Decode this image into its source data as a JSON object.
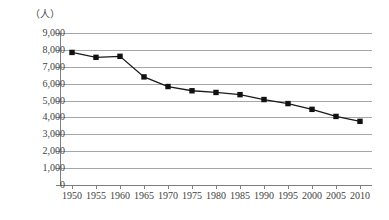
{
  "chart_data": {
    "type": "line",
    "title": "",
    "subtitle": "",
    "xlabel": "",
    "ylabel": "（人）",
    "unit_label": "（人）",
    "categories": [
      "1950",
      "1955",
      "1960",
      "1965",
      "1970",
      "1975",
      "1980",
      "1985",
      "1990",
      "1995",
      "2000",
      "2005",
      "2010"
    ],
    "x": [
      1950,
      1955,
      1960,
      1965,
      1970,
      1975,
      1980,
      1985,
      1990,
      1995,
      2000,
      2005,
      2010
    ],
    "values": [
      7850,
      7560,
      7620,
      6400,
      5830,
      5580,
      5480,
      5350,
      5060,
      4820,
      4480,
      4060,
      3770
    ],
    "series": [
      {
        "name": "",
        "values": [
          7850,
          7560,
          7620,
          6400,
          5830,
          5580,
          5480,
          5350,
          5060,
          4820,
          4480,
          4060,
          3770
        ]
      }
    ],
    "ylim": [
      0,
      9000
    ],
    "xlim": [
      1950,
      2010
    ],
    "ytick_labels": [
      "9,000",
      "8,000",
      "7,000",
      "6,000",
      "5,000",
      "4,000",
      "3,000",
      "2,000",
      "1,000",
      "0"
    ],
    "ytick_values": [
      9000,
      8000,
      7000,
      6000,
      5000,
      4000,
      3000,
      2000,
      1000,
      0
    ],
    "xtick_labels": [
      "1950",
      "1955",
      "1960",
      "1965",
      "1970",
      "1975",
      "1980",
      "1985",
      "1990",
      "1995",
      "2000",
      "2005",
      "2010"
    ],
    "grid": true,
    "grid_axis": "y",
    "legend": false,
    "legend_position": "none",
    "marker": "square",
    "line_color": "#1a1a1a",
    "marker_color": "#111111",
    "grid_color": "#a6a6a6",
    "axis_color": "#808080",
    "background": "#ffffff"
  }
}
